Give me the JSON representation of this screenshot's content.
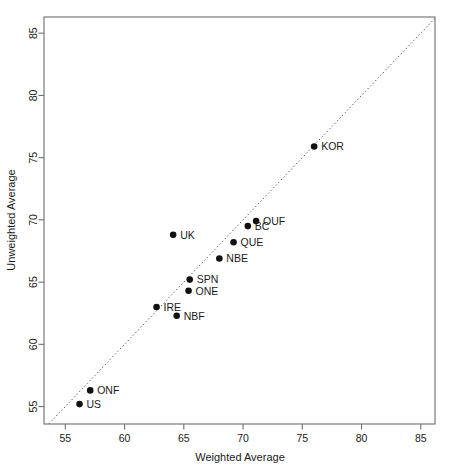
{
  "chart_data": {
    "type": "scatter",
    "title": "",
    "xlabel": "Weighted Average",
    "ylabel": "Unweighted Average",
    "xlim": [
      53.2,
      86.2
    ],
    "ylim": [
      53.6,
      86.3
    ],
    "xticks": [
      55,
      60,
      65,
      70,
      75,
      80,
      85
    ],
    "yticks": [
      55,
      60,
      65,
      70,
      75,
      80,
      85
    ],
    "grid": false,
    "legend": null,
    "annotations": [
      {
        "type": "identity-line",
        "label": "y = x reference line",
        "style": "dotted"
      }
    ],
    "points": [
      {
        "label": "US",
        "x": 56.2,
        "y": 55.2,
        "label_pos": "right"
      },
      {
        "label": "ONF",
        "x": 57.1,
        "y": 56.3,
        "label_pos": "right"
      },
      {
        "label": "IRE",
        "x": 62.7,
        "y": 63.0,
        "label_pos": "right"
      },
      {
        "label": "NBF",
        "x": 64.4,
        "y": 62.3,
        "label_pos": "right"
      },
      {
        "label": "UK",
        "x": 64.1,
        "y": 68.8,
        "label_pos": "right"
      },
      {
        "label": "ONE",
        "x": 65.4,
        "y": 64.3,
        "label_pos": "right"
      },
      {
        "label": "SPN",
        "x": 65.5,
        "y": 65.2,
        "label_pos": "right"
      },
      {
        "label": "NBE",
        "x": 68.0,
        "y": 66.9,
        "label_pos": "right"
      },
      {
        "label": "QUE",
        "x": 69.2,
        "y": 68.2,
        "label_pos": "right"
      },
      {
        "label": "BC",
        "x": 70.4,
        "y": 69.5,
        "label_pos": "right"
      },
      {
        "label": "OUF",
        "x": 71.1,
        "y": 69.9,
        "label_pos": "right"
      },
      {
        "label": "KOR",
        "x": 76.0,
        "y": 75.9,
        "label_pos": "right"
      }
    ]
  },
  "axes": {
    "x_title": "Weighted Average",
    "y_title": "Unweighted Average",
    "x_tick_labels": [
      "55",
      "60",
      "65",
      "70",
      "75",
      "80",
      "85"
    ],
    "y_tick_labels": [
      "55",
      "60",
      "65",
      "70",
      "75",
      "80",
      "85"
    ]
  },
  "colors": {
    "point": "#111111",
    "frame": "#6e6e6e",
    "reference_line": "#555555",
    "text": "#1a1a1a",
    "background": "#ffffff"
  }
}
